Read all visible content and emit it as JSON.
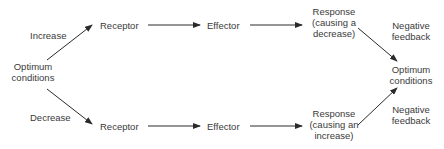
{
  "diagram": {
    "type": "negative-feedback-loop",
    "start": {
      "line1": "Optimum",
      "line2": "conditions"
    },
    "end": {
      "line1": "Optimum",
      "line2": "conditions"
    },
    "top_branch": {
      "trigger": "Increase",
      "receptor": "Receptor",
      "effector": "Effector",
      "response": {
        "line1": "Response",
        "line2": "(causing a",
        "line3": "decrease)"
      },
      "feedback": {
        "line1": "Negative",
        "line2": "feedback"
      }
    },
    "bottom_branch": {
      "trigger": "Decrease",
      "receptor": "Receptor",
      "effector": "Effector",
      "response": {
        "line1": "Response",
        "line2": "(causing an",
        "line3": "increase)"
      },
      "feedback": {
        "line1": "Negative",
        "line2": "feedback"
      }
    },
    "colors": {
      "text": "#3a3a3a",
      "arrow": "#2a2a2a",
      "background": "#ffffff"
    }
  }
}
